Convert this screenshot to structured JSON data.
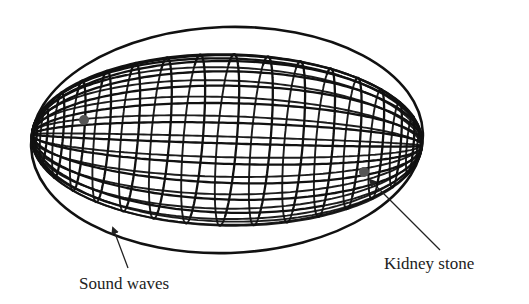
{
  "figure": {
    "labels": {
      "sound_waves": "Sound waves",
      "kidney_stone": "Kidney stone"
    },
    "ellipsoid": {
      "center": [
        227,
        140
      ],
      "rx": 196,
      "ry": 113,
      "tilt_deg": -2,
      "meridians": 26,
      "parallels": 18,
      "line_color": "#111111"
    },
    "foci": [
      {
        "name": "source-focus",
        "x": 84,
        "y": 120,
        "r": 5,
        "color": "#555555"
      },
      {
        "name": "kidney-stone-focus",
        "x": 364,
        "y": 172,
        "r": 5,
        "color": "#555555"
      }
    ],
    "pointers": {
      "sound_waves_arrow": {
        "from": [
          128,
          268
        ],
        "to": [
          113,
          228
        ]
      },
      "kidney_stone_line": {
        "from": [
          440,
          250
        ],
        "to": [
          370,
          180
        ]
      }
    }
  }
}
